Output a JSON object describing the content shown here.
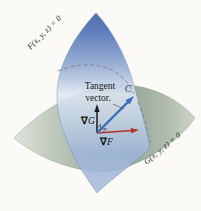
{
  "labels": {
    "surface_f": "F(x, y, z) = 0",
    "surface_g": "G(x, y, z) = 0",
    "tangent_line1": "Tangent",
    "tangent_line2": "vector.",
    "curve": "C",
    "nabla": "∇",
    "grad_g_letter": "G",
    "grad_f_letter": "F"
  },
  "colors": {
    "background": "#fbfaf6",
    "surface_f_top": "#3b5ca8",
    "surface_f_light": "#dde7f2",
    "surface_f_bottom": "#a9bcd8",
    "surface_g_dark": "#97a899",
    "surface_g_light": "#dfe3db",
    "grad_g_arrow": "#1c1c1c",
    "grad_f_arrow": "#b23327",
    "tangent_arrow": "#3d6cba",
    "curve_dash": "#7d828a",
    "text": "#1b1b1b",
    "curve_label": "#1e3c78"
  }
}
